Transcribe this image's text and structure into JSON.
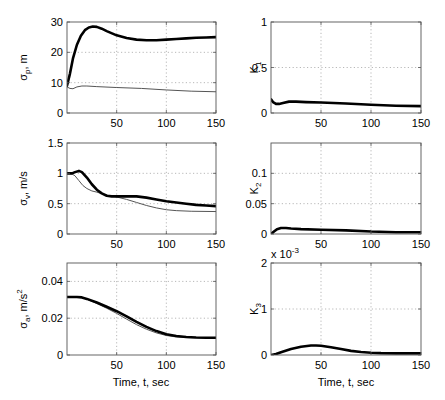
{
  "figure": {
    "xlabel": "Time, t, sec",
    "xlim": [
      0,
      150
    ],
    "xticks": [
      50,
      100,
      150
    ],
    "colors": {
      "thick": "#000000",
      "thin": "#555555",
      "grid": "#9a9a9a",
      "axes": "#555555"
    }
  },
  "chart_data": [
    {
      "id": "sigma_p",
      "type": "line",
      "title": "",
      "ylabel": "σ_p, m",
      "ylabel_main": "σ",
      "ylabel_sub": "p",
      "ylabel_rest": ", m",
      "xlabel": "",
      "xlim": [
        0,
        150
      ],
      "ylim": [
        0,
        30
      ],
      "yticks": [
        0,
        10,
        20,
        30
      ],
      "ytick_labels": [
        "0",
        "10",
        "20",
        "30"
      ],
      "xticks": [
        50,
        100,
        150
      ],
      "xtick_labels": [
        "50",
        "100",
        "150"
      ],
      "grid": true,
      "series": [
        {
          "name": "thick",
          "width": 2.6,
          "x": [
            0,
            3,
            6,
            10,
            14,
            18,
            22,
            26,
            30,
            35,
            40,
            50,
            60,
            70,
            80,
            90,
            100,
            110,
            120,
            130,
            140,
            150
          ],
          "values": [
            9,
            13,
            18,
            22.5,
            25.5,
            27.3,
            28.2,
            28.5,
            28.4,
            27.8,
            27,
            25.6,
            24.7,
            24.2,
            24.0,
            24.0,
            24.2,
            24.4,
            24.6,
            24.8,
            24.9,
            25.0
          ]
        },
        {
          "name": "thin",
          "width": 1,
          "x": [
            0,
            3,
            6,
            10,
            15,
            20,
            30,
            50,
            75,
            100,
            125,
            150
          ],
          "values": [
            8.6,
            8.1,
            8.0,
            8.6,
            8.9,
            8.9,
            8.7,
            8.4,
            8.1,
            7.6,
            7.2,
            7.0
          ]
        }
      ]
    },
    {
      "id": "K1",
      "type": "line",
      "ylabel": "K_1",
      "ylabel_main": "K",
      "ylabel_sub": "1",
      "ylabel_rest": "",
      "xlim": [
        0,
        150
      ],
      "ylim": [
        0,
        1
      ],
      "yticks": [
        0,
        0.5,
        1
      ],
      "ytick_labels": [
        "0",
        "0.5",
        "1"
      ],
      "xticks": [
        50,
        100,
        150
      ],
      "xtick_labels": [
        "50",
        "100",
        "150"
      ],
      "grid": true,
      "series": [
        {
          "name": "thick",
          "width": 2.6,
          "x": [
            0,
            2,
            5,
            8,
            12,
            18,
            25,
            35,
            50,
            75,
            100,
            125,
            150
          ],
          "values": [
            0.15,
            0.12,
            0.1,
            0.1,
            0.11,
            0.125,
            0.125,
            0.12,
            0.115,
            0.105,
            0.09,
            0.08,
            0.075
          ]
        }
      ]
    },
    {
      "id": "sigma_v",
      "type": "line",
      "ylabel": "σ_v, m/s",
      "ylabel_main": "σ",
      "ylabel_sub": "v",
      "ylabel_rest": ", m/s",
      "xlim": [
        0,
        150
      ],
      "ylim": [
        0,
        1.5
      ],
      "yticks": [
        0,
        0.5,
        1,
        1.5
      ],
      "ytick_labels": [
        "0",
        "0.5",
        "1",
        "1.5"
      ],
      "xticks": [
        50,
        100,
        150
      ],
      "xtick_labels": [
        "50",
        "100",
        "150"
      ],
      "grid": true,
      "series": [
        {
          "name": "thick",
          "width": 2.6,
          "x": [
            0,
            5,
            8,
            12,
            15,
            20,
            25,
            30,
            35,
            40,
            45,
            50,
            60,
            70,
            80,
            90,
            100,
            110,
            120,
            130,
            140,
            150
          ],
          "values": [
            1.0,
            1.0,
            1.02,
            1.04,
            1.02,
            0.93,
            0.82,
            0.73,
            0.67,
            0.63,
            0.62,
            0.62,
            0.62,
            0.62,
            0.6,
            0.57,
            0.54,
            0.52,
            0.5,
            0.48,
            0.47,
            0.46
          ]
        },
        {
          "name": "thin",
          "width": 1,
          "x": [
            0,
            5,
            8,
            12,
            16,
            20,
            25,
            30,
            40,
            50,
            60,
            70,
            80,
            90,
            100,
            110,
            125,
            150
          ],
          "values": [
            1.0,
            0.99,
            0.96,
            0.88,
            0.8,
            0.75,
            0.71,
            0.69,
            0.64,
            0.61,
            0.57,
            0.52,
            0.47,
            0.43,
            0.4,
            0.385,
            0.375,
            0.37
          ]
        }
      ]
    },
    {
      "id": "K2",
      "type": "line",
      "ylabel": "K_2",
      "ylabel_main": "K",
      "ylabel_sub": "2",
      "ylabel_rest": "",
      "xlim": [
        0,
        150
      ],
      "ylim": [
        0,
        0.15
      ],
      "yticks": [
        0,
        0.05,
        0.1
      ],
      "ytick_labels": [
        "0",
        "0.05",
        "0.1"
      ],
      "xticks": [
        50,
        100,
        150
      ],
      "xtick_labels": [
        "50",
        "100",
        "150"
      ],
      "grid": true,
      "series": [
        {
          "name": "thick",
          "width": 2.6,
          "x": [
            0,
            3,
            6,
            10,
            15,
            20,
            30,
            50,
            75,
            100,
            125,
            150
          ],
          "values": [
            0.0,
            0.004,
            0.008,
            0.01,
            0.01,
            0.009,
            0.008,
            0.007,
            0.006,
            0.004,
            0.003,
            0.003
          ]
        }
      ]
    },
    {
      "id": "sigma_a",
      "type": "line",
      "ylabel": "σ_a, m/s²",
      "ylabel_main": "σ",
      "ylabel_sub": "a",
      "ylabel_rest": ", m/s",
      "ylabel_sup": "2",
      "xlabel": "Time, t, sec",
      "xlim": [
        0,
        150
      ],
      "ylim": [
        0,
        0.05
      ],
      "yticks": [
        0,
        0.02,
        0.04
      ],
      "ytick_labels": [
        "0",
        "0.02",
        "0.04"
      ],
      "xticks": [
        50,
        100,
        150
      ],
      "xtick_labels": [
        "50",
        "100",
        "150"
      ],
      "grid": true,
      "series": [
        {
          "name": "thick",
          "width": 2.6,
          "x": [
            0,
            10,
            15,
            20,
            30,
            40,
            50,
            60,
            70,
            80,
            90,
            100,
            110,
            120,
            130,
            140,
            150
          ],
          "values": [
            0.0315,
            0.0315,
            0.0313,
            0.0305,
            0.0285,
            0.0262,
            0.0238,
            0.021,
            0.018,
            0.0153,
            0.013,
            0.0113,
            0.0103,
            0.0098,
            0.0095,
            0.0094,
            0.0094
          ]
        },
        {
          "name": "thin",
          "width": 1,
          "x": [
            0,
            10,
            15,
            20,
            30,
            40,
            50,
            60,
            70,
            80,
            90,
            100,
            110,
            120,
            130,
            140,
            150
          ],
          "values": [
            0.0315,
            0.0315,
            0.0312,
            0.0303,
            0.028,
            0.0254,
            0.0226,
            0.0195,
            0.0165,
            0.014,
            0.012,
            0.0106,
            0.0098,
            0.0095,
            0.0094,
            0.0093,
            0.0093
          ]
        }
      ]
    },
    {
      "id": "K3",
      "type": "line",
      "ylabel": "K_3",
      "ylabel_main": "K",
      "ylabel_sub": "3",
      "ylabel_rest": "",
      "xlabel": "Time, t, sec",
      "xlim": [
        0,
        150
      ],
      "ylim": [
        0,
        2
      ],
      "yticks": [
        0,
        1,
        2
      ],
      "ytick_labels": [
        "0",
        "1",
        "2"
      ],
      "xticks": [
        50,
        100,
        150
      ],
      "xtick_labels": [
        "50",
        "100",
        "150"
      ],
      "exponent_label": "x 10",
      "exponent_sup": "-3",
      "grid": true,
      "series": [
        {
          "name": "thick",
          "width": 2.6,
          "x": [
            0,
            5,
            10,
            20,
            30,
            40,
            45,
            50,
            60,
            70,
            80,
            90,
            100,
            110,
            125,
            150
          ],
          "values": [
            0.0,
            0.02,
            0.06,
            0.13,
            0.18,
            0.205,
            0.205,
            0.2,
            0.17,
            0.13,
            0.09,
            0.065,
            0.05,
            0.04,
            0.035,
            0.035
          ]
        }
      ]
    }
  ]
}
